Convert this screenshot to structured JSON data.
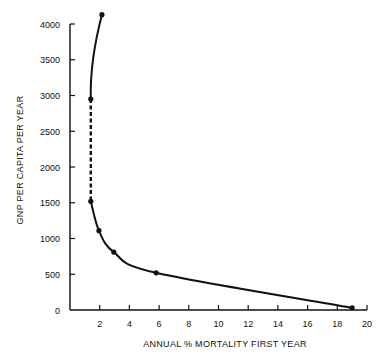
{
  "chart_data": {
    "type": "line",
    "title": "",
    "xlabel": "ANNUAL % MORTALITY FIRST YEAR",
    "ylabel": "GNP PER CAPITA PER YEAR",
    "xlim": [
      0,
      20
    ],
    "ylim": [
      0,
      4000
    ],
    "xticks": [
      2,
      4,
      6,
      8,
      10,
      12,
      14,
      16,
      18,
      20
    ],
    "yticks": [
      0,
      500,
      1000,
      1500,
      2000,
      2500,
      3000,
      3500,
      4000
    ],
    "grid": false,
    "legend": null,
    "series": [
      {
        "name": "GNP vs infant mortality",
        "points": [
          {
            "x": 2.15,
            "y": 4130
          },
          {
            "x": 1.4,
            "y": 2950
          },
          {
            "x": 1.4,
            "y": 1520
          },
          {
            "x": 1.95,
            "y": 1110
          },
          {
            "x": 2.95,
            "y": 810
          },
          {
            "x": 5.8,
            "y": 520
          },
          {
            "x": 19.0,
            "y": 30
          }
        ],
        "segments": [
          {
            "from": 0,
            "to": 1,
            "style": "solid"
          },
          {
            "from": 1,
            "to": 2,
            "style": "dashed"
          },
          {
            "from": 2,
            "to": 6,
            "style": "solid"
          }
        ]
      }
    ]
  },
  "colors": {
    "ink": "#111111",
    "background": "#ffffff"
  }
}
